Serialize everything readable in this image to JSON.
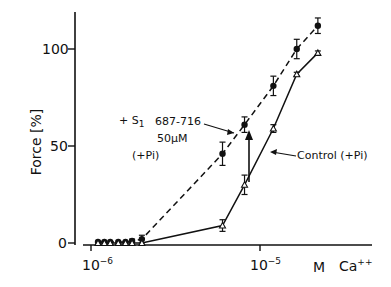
{
  "chart_data": {
    "type": "line",
    "title": "",
    "xlabel": "M Ca++",
    "ylabel": "Force [%]",
    "x_scale": "log",
    "x_ticks": [
      "10^-6",
      "10^-5"
    ],
    "y_ticks": [
      0,
      50,
      100
    ],
    "ylim": [
      0,
      120
    ],
    "grid": false,
    "series": [
      {
        "name": "+ S1 687-716 50µM (+Pi)",
        "style": "dashed",
        "marker": "filled-circle",
        "x": [
          1.1e-06,
          1.2e-06,
          1.3e-06,
          1.45e-06,
          1.6e-06,
          1.75e-06,
          2e-06,
          6e-06,
          8.1e-06,
          1.2e-05,
          1.65e-05,
          2.2e-05
        ],
        "values": [
          0.5,
          0.5,
          0.5,
          0.5,
          0.5,
          1,
          2,
          46,
          61,
          81,
          100,
          112
        ],
        "errors": [
          0.5,
          0.5,
          0.5,
          0.5,
          0.5,
          1,
          2,
          6,
          4,
          5,
          5,
          4
        ]
      },
      {
        "name": "Control (+Pi)",
        "style": "solid",
        "marker": "open-triangle",
        "x": [
          1.1e-06,
          1.2e-06,
          1.3e-06,
          1.45e-06,
          1.6e-06,
          1.75e-06,
          2e-06,
          6e-06,
          8.1e-06,
          1.2e-05,
          1.65e-05,
          2.2e-05
        ],
        "values": [
          0,
          0,
          0,
          0,
          0,
          0,
          0,
          9,
          30,
          59,
          87,
          98
        ],
        "errors": [
          0,
          0,
          0,
          0,
          0,
          0,
          0,
          3,
          5,
          2,
          1,
          1
        ]
      }
    ],
    "annotations": [
      {
        "text": "+ S1 687-716",
        "line2": "50µM",
        "line3": "(+Pi)",
        "points_to": "dashed series at ~8e-6"
      },
      {
        "text": "Control (+Pi)",
        "points_to": "solid series at ~1.2e-5"
      },
      {
        "type": "arrow",
        "from": 30,
        "to": 61,
        "x": 8.1e-06
      }
    ]
  },
  "labels": {
    "ylabel": "Force [%]",
    "y100": "100",
    "y50": "50",
    "y0": "0",
    "x_tick1_base": "10",
    "x_tick1_exp": "−6",
    "x_tick2_base": "10",
    "x_tick2_exp": "−5",
    "x_unit": "M",
    "x_ion": "Ca",
    "x_ion_charge": "++",
    "s1_prefix": "+ S",
    "s1_sub": "1",
    "s1_range": "687-716",
    "s1_conc": "50µM",
    "s1_pi": "(+Pi)",
    "control_label": "Control (+Pi)"
  }
}
